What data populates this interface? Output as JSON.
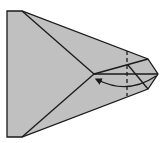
{
  "diagram": {
    "type": "origami-fold-step",
    "colors": {
      "paper": "#c0c0c0",
      "line": "#1a1a1a",
      "background": "#ffffff"
    },
    "outline_points": "7,11 22,11 148,59 158,74 148,89 22,137 7,137",
    "crease_lines": [
      {
        "x1": 22,
        "y1": 11,
        "x2": 94,
        "y2": 74
      },
      {
        "x1": 22,
        "y1": 137,
        "x2": 94,
        "y2": 74
      },
      {
        "x1": 94,
        "y1": 74,
        "x2": 148,
        "y2": 59
      },
      {
        "x1": 94,
        "y1": 74,
        "x2": 158,
        "y2": 74
      },
      {
        "x1": 128,
        "y1": 65,
        "x2": 148,
        "y2": 89
      }
    ],
    "dashed_line": {
      "x1": 127,
      "y1": 51,
      "x2": 127,
      "y2": 96
    },
    "arrow_path": "M 156 76 Q 128 95 98 80"
  }
}
